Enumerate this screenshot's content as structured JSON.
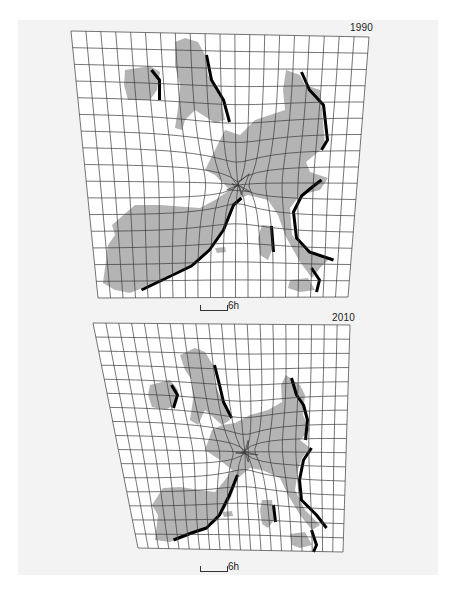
{
  "figure": {
    "background_color": "#f3f3f3",
    "land_color": "#b4b4b4",
    "grid_color": "#3a3a3a",
    "shadow_color": "#000000"
  },
  "maps": [
    {
      "year": "1990",
      "scale_label": "6h",
      "grid": {
        "cols": 20,
        "rows": 16,
        "corners": {
          "tl": [
            71,
            31
          ],
          "tr": [
            369,
            37
          ],
          "bl": [
            98,
            298
          ],
          "br": [
            348,
            297
          ]
        },
        "warp": {
          "cx": 238,
          "cy": 185,
          "strength": 22
        }
      },
      "land": [
        {
          "name": "iberia",
          "points": [
            [
              103,
              283
            ],
            [
              108,
              245
            ],
            [
              115,
              235
            ],
            [
              112,
              225
            ],
            [
              135,
              205
            ],
            [
              160,
              205
            ],
            [
              200,
              208
            ],
            [
              215,
              200
            ],
            [
              230,
              190
            ],
            [
              238,
              200
            ],
            [
              225,
              225
            ],
            [
              210,
              250
            ],
            [
              195,
              265
            ],
            [
              175,
              272
            ],
            [
              150,
              285
            ],
            [
              130,
              293
            ],
            [
              115,
              290
            ]
          ]
        },
        {
          "name": "central-europe",
          "points": [
            [
              205,
              170
            ],
            [
              225,
              130
            ],
            [
              240,
              135
            ],
            [
              255,
              120
            ],
            [
              270,
              115
            ],
            [
              285,
              110
            ],
            [
              283,
              90
            ],
            [
              286,
              70
            ],
            [
              300,
              75
            ],
            [
              305,
              85
            ],
            [
              320,
              90
            ],
            [
              322,
              110
            ],
            [
              325,
              145
            ],
            [
              318,
              152
            ],
            [
              306,
              162
            ],
            [
              310,
              172
            ],
            [
              328,
              178
            ],
            [
              320,
              190
            ],
            [
              300,
              195
            ],
            [
              290,
              208
            ],
            [
              292,
              235
            ],
            [
              305,
              250
            ],
            [
              330,
              258
            ],
            [
              320,
              268
            ],
            [
              312,
              278
            ],
            [
              300,
              262
            ],
            [
              285,
              235
            ],
            [
              278,
              215
            ],
            [
              268,
              200
            ],
            [
              248,
              195
            ],
            [
              235,
              200
            ],
            [
              230,
              190
            ],
            [
              215,
              175
            ]
          ]
        },
        {
          "name": "great-britain",
          "points": [
            [
              175,
              42
            ],
            [
              185,
              38
            ],
            [
              198,
              42
            ],
            [
              205,
              55
            ],
            [
              208,
              75
            ],
            [
              220,
              95
            ],
            [
              225,
              120
            ],
            [
              215,
              123
            ],
            [
              195,
              110
            ],
            [
              185,
              120
            ],
            [
              182,
              130
            ],
            [
              175,
              128
            ],
            [
              178,
              108
            ],
            [
              180,
              85
            ],
            [
              175,
              65
            ]
          ]
        },
        {
          "name": "ireland",
          "points": [
            [
              125,
              70
            ],
            [
              150,
              66
            ],
            [
              160,
              72
            ],
            [
              157,
              90
            ],
            [
              150,
              100
            ],
            [
              128,
              100
            ],
            [
              124,
              85
            ]
          ]
        },
        {
          "name": "corsica-sardinia",
          "points": [
            [
              262,
              225
            ],
            [
              272,
              226
            ],
            [
              272,
              250
            ],
            [
              268,
              260
            ],
            [
              260,
              255
            ],
            [
              258,
              238
            ]
          ]
        },
        {
          "name": "sicily",
          "points": [
            [
              290,
              280
            ],
            [
              308,
              278
            ],
            [
              315,
              290
            ],
            [
              300,
              292
            ],
            [
              288,
              288
            ]
          ]
        },
        {
          "name": "baleares",
          "points": [
            [
              215,
              248
            ],
            [
              225,
              247
            ],
            [
              226,
              252
            ],
            [
              217,
              253
            ]
          ]
        }
      ],
      "shadows": [
        {
          "points": [
            [
              140,
              290
            ],
            [
              165,
              278
            ],
            [
              190,
              266
            ],
            [
              208,
              250
            ],
            [
              222,
              230
            ],
            [
              232,
              205
            ],
            [
              240,
              198
            ]
          ]
        },
        {
          "points": [
            [
              205,
              55
            ],
            [
              210,
              80
            ],
            [
              222,
              100
            ],
            [
              228,
              122
            ]
          ]
        },
        {
          "points": [
            [
              300,
              72
            ],
            [
              308,
              90
            ],
            [
              322,
              105
            ],
            [
              326,
              140
            ],
            [
              320,
              150
            ]
          ]
        },
        {
          "points": [
            [
              320,
              180
            ],
            [
              312,
              186
            ],
            [
              300,
              196
            ],
            [
              292,
              212
            ],
            [
              295,
              238
            ],
            [
              308,
              252
            ],
            [
              332,
              260
            ]
          ]
        },
        {
          "points": [
            [
              270,
              226
            ],
            [
              272,
              252
            ]
          ]
        },
        {
          "points": [
            [
              310,
              268
            ],
            [
              318,
              280
            ],
            [
              315,
              292
            ]
          ]
        },
        {
          "points": [
            [
              150,
              70
            ],
            [
              158,
              80
            ],
            [
              158,
              100
            ]
          ]
        }
      ],
      "year_label_pos": [
        350,
        22
      ],
      "scale_pos": [
        200,
        301
      ]
    },
    {
      "year": "2010",
      "scale_label": "6h",
      "grid": {
        "cols": 20,
        "rows": 16,
        "corners": {
          "tl": [
            93,
            323
          ],
          "tr": [
            350,
            325
          ],
          "bl": [
            138,
            548
          ],
          "br": [
            343,
            552
          ]
        },
        "warp": {
          "cx": 245,
          "cy": 452,
          "strength": 18
        }
      },
      "land": [
        {
          "name": "iberia",
          "points": [
            [
              155,
              540
            ],
            [
              158,
              515
            ],
            [
              152,
              505
            ],
            [
              163,
              488
            ],
            [
              180,
              487
            ],
            [
              200,
              490
            ],
            [
              215,
              492
            ],
            [
              225,
              480
            ],
            [
              232,
              470
            ],
            [
              238,
              478
            ],
            [
              230,
              500
            ],
            [
              218,
              520
            ],
            [
              205,
              530
            ],
            [
              190,
              535
            ],
            [
              170,
              542
            ]
          ]
        },
        {
          "name": "central-europe",
          "points": [
            [
              205,
              450
            ],
            [
              212,
              430
            ],
            [
              222,
              425
            ],
            [
              235,
              423
            ],
            [
              250,
              415
            ],
            [
              268,
              410
            ],
            [
              282,
              402
            ],
            [
              281,
              385
            ],
            [
              286,
              375
            ],
            [
              300,
              385
            ],
            [
              305,
              395
            ],
            [
              303,
              415
            ],
            [
              310,
              430
            ],
            [
              300,
              440
            ],
            [
              310,
              448
            ],
            [
              302,
              458
            ],
            [
              298,
              470
            ],
            [
              295,
              490
            ],
            [
              305,
              510
            ],
            [
              320,
              525
            ],
            [
              312,
              530
            ],
            [
              300,
              515
            ],
            [
              288,
              495
            ],
            [
              280,
              478
            ],
            [
              262,
              470
            ],
            [
              250,
              468
            ],
            [
              238,
              478
            ],
            [
              232,
              470
            ],
            [
              220,
              460
            ]
          ]
        },
        {
          "name": "great-britain",
          "points": [
            [
              180,
              355
            ],
            [
              195,
              348
            ],
            [
              205,
              352
            ],
            [
              213,
              365
            ],
            [
              215,
              385
            ],
            [
              222,
              400
            ],
            [
              230,
              420
            ],
            [
              222,
              425
            ],
            [
              205,
              410
            ],
            [
              198,
              425
            ],
            [
              190,
              420
            ],
            [
              193,
              400
            ],
            [
              192,
              380
            ],
            [
              185,
              370
            ]
          ]
        },
        {
          "name": "ireland",
          "points": [
            [
              150,
              385
            ],
            [
              170,
              380
            ],
            [
              178,
              390
            ],
            [
              175,
              405
            ],
            [
              165,
              410
            ],
            [
              152,
              407
            ],
            [
              148,
              395
            ]
          ]
        },
        {
          "name": "corsica-sardinia",
          "points": [
            [
              262,
              500
            ],
            [
              272,
              500
            ],
            [
              274,
              520
            ],
            [
              268,
              528
            ],
            [
              262,
              524
            ],
            [
              260,
              510
            ]
          ]
        },
        {
          "name": "sicily",
          "points": [
            [
              290,
              534
            ],
            [
              305,
              532
            ],
            [
              312,
              545
            ],
            [
              300,
              548
            ],
            [
              292,
              545
            ]
          ]
        },
        {
          "name": "baleares",
          "points": [
            [
              222,
              512
            ],
            [
              232,
              511
            ],
            [
              233,
              516
            ],
            [
              224,
              517
            ]
          ]
        }
      ],
      "shadows": [
        {
          "points": [
            [
              172,
              540
            ],
            [
              190,
              533
            ],
            [
              205,
              528
            ],
            [
              218,
              515
            ],
            [
              228,
              495
            ],
            [
              236,
              475
            ]
          ]
        },
        {
          "points": [
            [
              213,
              365
            ],
            [
              218,
              385
            ],
            [
              222,
              402
            ],
            [
              230,
              418
            ]
          ]
        },
        {
          "points": [
            [
              290,
              378
            ],
            [
              295,
              395
            ],
            [
              302,
              405
            ],
            [
              306,
              420
            ],
            [
              304,
              440
            ]
          ]
        },
        {
          "points": [
            [
              310,
              448
            ],
            [
              302,
              460
            ],
            [
              298,
              480
            ],
            [
              300,
              500
            ],
            [
              315,
              515
            ],
            [
              325,
              528
            ]
          ]
        },
        {
          "points": [
            [
              272,
              505
            ],
            [
              274,
              522
            ]
          ]
        },
        {
          "points": [
            [
              310,
              530
            ],
            [
              315,
              545
            ],
            [
              312,
              552
            ]
          ]
        },
        {
          "points": [
            [
              170,
              385
            ],
            [
              176,
              395
            ],
            [
              172,
              408
            ]
          ]
        }
      ],
      "year_label_pos": [
        332,
        312
      ],
      "scale_pos": [
        200,
        562
      ]
    }
  ]
}
